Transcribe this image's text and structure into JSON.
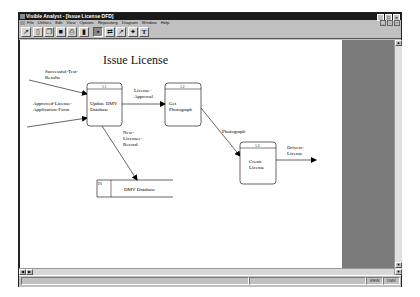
{
  "window": {
    "title": "Visible Analyst - [Issue License DFD]",
    "controls": [
      "minimize",
      "maximize",
      "close"
    ]
  },
  "menubar": {
    "items": [
      "File",
      "Utilities",
      "Edit",
      "View",
      "Options",
      "Repository",
      "Diagram",
      "Window",
      "Help"
    ]
  },
  "toolbar": {
    "buttons": [
      {
        "name": "open",
        "glyph": "↗"
      },
      {
        "name": "new",
        "glyph": "▯"
      },
      {
        "name": "copy",
        "glyph": "❐"
      },
      {
        "name": "save",
        "glyph": "■"
      },
      {
        "name": "print",
        "glyph": "⎙"
      },
      {
        "name": "delete",
        "glyph": "▮"
      },
      {
        "name": "select",
        "glyph": "▪"
      },
      {
        "name": "process",
        "glyph": "⇄"
      },
      {
        "name": "connect",
        "glyph": "↗"
      },
      {
        "name": "object",
        "glyph": "✦"
      },
      {
        "name": "text",
        "glyph": "T"
      }
    ]
  },
  "diagram": {
    "title": "Issue License",
    "processes": [
      {
        "id": "1.1",
        "label_line1": "Update DMV",
        "label_line2": "Database"
      },
      {
        "id": "1.2",
        "label_line1": "Get",
        "label_line2": "Photograph"
      },
      {
        "id": "1.3",
        "label_line1": "Create",
        "label_line2": "License"
      }
    ],
    "data_store": {
      "id": "D1",
      "label": "DMV Database"
    },
    "flows": [
      {
        "line1": "Successful-Test-",
        "line2": "Results"
      },
      {
        "line1": "Approved-License-",
        "line2": "Application-Form"
      },
      {
        "line1": "License-",
        "line2": "Approval"
      },
      {
        "line1": "Photograph",
        "line2": ""
      },
      {
        "line1": "New-",
        "line2": "Licensee-",
        "line3": "Record"
      },
      {
        "line1": "Drivers-",
        "line2": "License"
      }
    ]
  },
  "statusbar": {
    "mode": "VIEW",
    "project": "DMV"
  },
  "colors": {
    "titlebar": "#1a1a1a",
    "chrome": "#c0c0c0",
    "offpage": "#7a7a7a",
    "canvas": "#ffffff"
  }
}
